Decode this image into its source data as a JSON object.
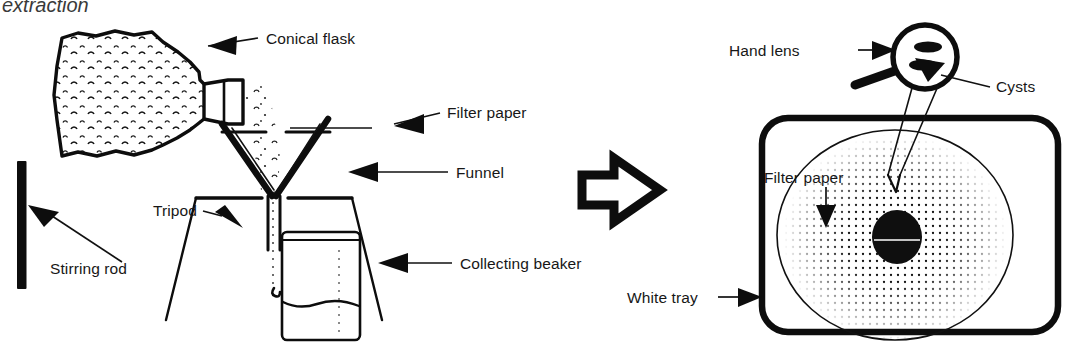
{
  "figure": {
    "caption_title": "extraction",
    "background_color": "#ffffff",
    "ink_color": "#0d0d0d",
    "text_color": "#171717"
  },
  "left_panel": {
    "name": "filtration-apparatus",
    "labels": {
      "conical_flask": "Conical flask",
      "filter_paper": "Filter paper",
      "funnel": "Funnel",
      "tripod": "Tripod",
      "collecting_beaker": "Collecting beaker",
      "stirring_rod": "Stirring rod"
    }
  },
  "transition": {
    "name": "process-arrow",
    "direction": "right"
  },
  "right_panel": {
    "name": "examination-setup",
    "labels": {
      "hand_lens": "Hand lens",
      "cysts": "Cysts",
      "filter_paper": "Filter paper",
      "white_tray": "White tray"
    }
  }
}
